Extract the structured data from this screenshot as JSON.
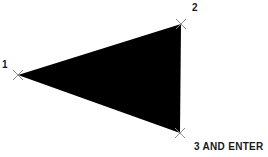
{
  "diagram": {
    "type": "filled-triangle",
    "fill_color": "#000000",
    "marker_color": "#8a8a8a",
    "vertices": [
      {
        "id": 1,
        "x": 18,
        "y": 75,
        "label": "1"
      },
      {
        "id": 2,
        "x": 181,
        "y": 24,
        "label": "2"
      },
      {
        "id": 3,
        "x": 180,
        "y": 133,
        "label": "3 AND ENTER"
      }
    ]
  }
}
